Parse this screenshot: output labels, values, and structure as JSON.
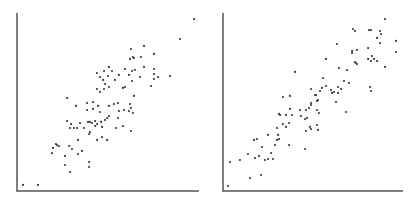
{
  "chart_data": [
    {
      "type": "scatter",
      "title": "",
      "xlabel": "",
      "ylabel": "",
      "xlim": [
        0,
        100
      ],
      "ylim": [
        0,
        100
      ],
      "grid": false,
      "legend": null,
      "axis_color": "#555555",
      "point_color": "#3a3a3a",
      "frame": {
        "left": 17,
        "top": 13,
        "bottom": 191,
        "right": 199
      },
      "points": [
        [
          97.3,
          96.6
        ],
        [
          89.6,
          85.4
        ],
        [
          69.8,
          81.5
        ],
        [
          62.6,
          79.8
        ],
        [
          75.3,
          77.0
        ],
        [
          62.1,
          74.2
        ],
        [
          63.7,
          75.3
        ],
        [
          64.3,
          74.7
        ],
        [
          68.1,
          75.3
        ],
        [
          69.8,
          69.7
        ],
        [
          75.3,
          68.5
        ],
        [
          64.8,
          68.0
        ],
        [
          63.2,
          67.4
        ],
        [
          59.3,
          68.5
        ],
        [
          61.5,
          65.2
        ],
        [
          67.6,
          64.0
        ],
        [
          75.3,
          65.7
        ],
        [
          77.5,
          64.0
        ],
        [
          75.3,
          62.9
        ],
        [
          84.1,
          64.6
        ],
        [
          73.6,
          59.0
        ],
        [
          63.2,
          61.8
        ],
        [
          50.5,
          69.7
        ],
        [
          47.8,
          67.4
        ],
        [
          52.2,
          67.4
        ],
        [
          43.9,
          66.3
        ],
        [
          50.0,
          64.6
        ],
        [
          47.3,
          62.4
        ],
        [
          45.6,
          64.0
        ],
        [
          56.0,
          65.2
        ],
        [
          53.8,
          62.4
        ],
        [
          48.4,
          60.1
        ],
        [
          50.5,
          58.4
        ],
        [
          47.8,
          57.3
        ],
        [
          43.9,
          57.3
        ],
        [
          45.6,
          55.6
        ],
        [
          58.2,
          57.9
        ],
        [
          59.3,
          58.4
        ],
        [
          64.3,
          53.4
        ],
        [
          27.5,
          52.2
        ],
        [
          32.4,
          47.8
        ],
        [
          38.5,
          49.4
        ],
        [
          41.8,
          50.0
        ],
        [
          44.5,
          47.8
        ],
        [
          38.5,
          45.5
        ],
        [
          41.8,
          46.1
        ],
        [
          50.5,
          47.8
        ],
        [
          53.3,
          48.9
        ],
        [
          55.5,
          49.4
        ],
        [
          62.1,
          48.9
        ],
        [
          62.6,
          46.6
        ],
        [
          61.5,
          44.9
        ],
        [
          58.8,
          45.5
        ],
        [
          63.7,
          43.8
        ],
        [
          56.0,
          44.9
        ],
        [
          27.5,
          39.3
        ],
        [
          29.7,
          37.6
        ],
        [
          29.1,
          35.4
        ],
        [
          31.3,
          35.4
        ],
        [
          33.0,
          35.4
        ],
        [
          34.6,
          38.2
        ],
        [
          36.8,
          35.4
        ],
        [
          39.0,
          38.8
        ],
        [
          40.1,
          38.8
        ],
        [
          41.2,
          38.2
        ],
        [
          42.9,
          39.3
        ],
        [
          44.0,
          37.6
        ],
        [
          42.9,
          36.5
        ],
        [
          45.6,
          44.4
        ],
        [
          46.2,
          38.8
        ],
        [
          48.4,
          39.9
        ],
        [
          49.5,
          41.0
        ],
        [
          50.5,
          42.1
        ],
        [
          46.7,
          36.0
        ],
        [
          39.6,
          32.0
        ],
        [
          40.1,
          33.1
        ],
        [
          44.0,
          28.7
        ],
        [
          46.7,
          30.3
        ],
        [
          49.5,
          28.7
        ],
        [
          54.4,
          35.4
        ],
        [
          55.5,
          41.0
        ],
        [
          58.2,
          36.5
        ],
        [
          62.6,
          33.7
        ],
        [
          19.2,
          21.3
        ],
        [
          19.8,
          24.2
        ],
        [
          21.4,
          26.4
        ],
        [
          22.0,
          25.8
        ],
        [
          23.1,
          25.3
        ],
        [
          28.6,
          25.3
        ],
        [
          30.2,
          23.6
        ],
        [
          33.5,
          28.7
        ],
        [
          33.5,
          20.8
        ],
        [
          35.7,
          22.5
        ],
        [
          26.4,
          19.7
        ],
        [
          26.4,
          14.6
        ],
        [
          29.1,
          10.7
        ],
        [
          39.6,
          16.3
        ],
        [
          39.6,
          13.5
        ],
        [
          3.3,
          3.4
        ],
        [
          11.5,
          3.4
        ]
      ]
    },
    {
      "type": "scatter",
      "title": "",
      "xlabel": "",
      "ylabel": "",
      "xlim": [
        0,
        100
      ],
      "ylim": [
        0,
        100
      ],
      "grid": false,
      "legend": null,
      "axis_color": "#555555",
      "point_color": "#3a3a3a",
      "frame": {
        "left": 13,
        "top": 13,
        "bottom": 191,
        "right": 193
      },
      "points": [
        [
          90.0,
          96.6
        ],
        [
          72.2,
          91.0
        ],
        [
          73.3,
          89.9
        ],
        [
          81.1,
          90.4
        ],
        [
          82.2,
          90.4
        ],
        [
          87.2,
          89.9
        ],
        [
          87.8,
          88.2
        ],
        [
          85.6,
          86.0
        ],
        [
          96.1,
          84.3
        ],
        [
          87.2,
          83.1
        ],
        [
          63.3,
          82.6
        ],
        [
          80.6,
          80.3
        ],
        [
          74.4,
          79.2
        ],
        [
          71.7,
          78.7
        ],
        [
          71.7,
          77.5
        ],
        [
          96.1,
          78.1
        ],
        [
          82.8,
          75.8
        ],
        [
          80.6,
          74.2
        ],
        [
          82.2,
          73.0
        ],
        [
          83.9,
          74.2
        ],
        [
          85.6,
          73.0
        ],
        [
          73.3,
          72.5
        ],
        [
          73.8,
          71.9
        ],
        [
          74.4,
          71.3
        ],
        [
          90.0,
          69.7
        ],
        [
          57.2,
          74.2
        ],
        [
          64.4,
          69.1
        ],
        [
          68.9,
          68.0
        ],
        [
          40.0,
          66.9
        ],
        [
          55.6,
          63.5
        ],
        [
          57.2,
          59.0
        ],
        [
          55.0,
          57.9
        ],
        [
          53.9,
          56.2
        ],
        [
          48.9,
          57.3
        ],
        [
          51.7,
          53.9
        ],
        [
          51.1,
          53.9
        ],
        [
          60.0,
          56.7
        ],
        [
          60.6,
          55.1
        ],
        [
          61.7,
          55.6
        ],
        [
          63.9,
          55.1
        ],
        [
          63.9,
          58.4
        ],
        [
          65.6,
          57.3
        ],
        [
          67.2,
          61.8
        ],
        [
          70.0,
          60.7
        ],
        [
          81.7,
          58.4
        ],
        [
          82.2,
          56.2
        ],
        [
          62.8,
          50.0
        ],
        [
          68.3,
          44.4
        ],
        [
          52.8,
          51.1
        ],
        [
          52.2,
          50.6
        ],
        [
          48.9,
          48.3
        ],
        [
          47.8,
          46.6
        ],
        [
          48.9,
          49.4
        ],
        [
          52.2,
          45.5
        ],
        [
          53.3,
          43.8
        ],
        [
          46.1,
          45.5
        ],
        [
          42.8,
          45.5
        ],
        [
          43.3,
          42.1
        ],
        [
          45.6,
          40.4
        ],
        [
          46.7,
          41.0
        ],
        [
          33.3,
          52.8
        ],
        [
          37.2,
          53.4
        ],
        [
          37.2,
          46.1
        ],
        [
          38.3,
          42.7
        ],
        [
          35.0,
          42.7
        ],
        [
          31.7,
          42.7
        ],
        [
          31.1,
          43.3
        ],
        [
          33.3,
          37.6
        ],
        [
          35.0,
          36.0
        ],
        [
          36.7,
          38.2
        ],
        [
          30.0,
          35.4
        ],
        [
          46.1,
          33.7
        ],
        [
          48.3,
          36.0
        ],
        [
          48.9,
          34.8
        ],
        [
          52.2,
          37.1
        ],
        [
          52.8,
          34.3
        ],
        [
          30.6,
          31.5
        ],
        [
          31.1,
          29.2
        ],
        [
          30.0,
          28.7
        ],
        [
          25.0,
          31.5
        ],
        [
          28.9,
          25.8
        ],
        [
          36.7,
          25.8
        ],
        [
          45.6,
          23.6
        ],
        [
          17.2,
          28.7
        ],
        [
          18.9,
          29.2
        ],
        [
          21.7,
          24.7
        ],
        [
          20.0,
          19.7
        ],
        [
          17.8,
          18.5
        ],
        [
          13.9,
          20.8
        ],
        [
          26.7,
          21.3
        ],
        [
          25.0,
          18.0
        ],
        [
          23.3,
          17.4
        ],
        [
          27.8,
          18.0
        ],
        [
          9.4,
          17.4
        ],
        [
          3.9,
          16.3
        ],
        [
          15.0,
          7.3
        ],
        [
          21.1,
          9.0
        ],
        [
          2.8,
          2.8
        ]
      ]
    }
  ]
}
